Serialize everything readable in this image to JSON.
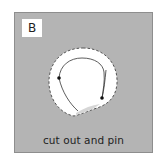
{
  "panel": {
    "label": "B",
    "caption": "cut out and pin",
    "colors": {
      "panel_fill": "#b4b4b4",
      "panel_border": "#8e8e8e",
      "cutout_fill": "#ffffff",
      "dash_stroke": "#555555",
      "leaf_outline": "#333333",
      "pin_dot": "#111111"
    }
  },
  "figure": {
    "cutout_shape": "dashed-circle",
    "inner_shape": "leaf-outline",
    "pins": 2
  }
}
